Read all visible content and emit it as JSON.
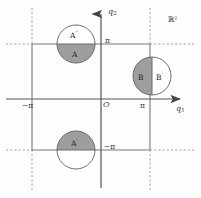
{
  "figure": {
    "name": "torus-fundamental-domain-diagram",
    "plane_label": "ℝ²",
    "origin_label": "O",
    "axes": {
      "x_label": "q",
      "x_sub": "1",
      "y_label": "q",
      "y_sub": "2"
    },
    "ticks": {
      "x_neg_pi": "−π",
      "x_pos_pi": "π",
      "y_pos_pi": "π",
      "y_neg_pi": "−π"
    },
    "regions": [
      {
        "id": "circle-top-left",
        "center_label_upper": "A",
        "upper_prime": "″",
        "center_label_lower": "A",
        "lower_prime": "",
        "split": "horizontal",
        "shaded_half": "lower"
      },
      {
        "id": "circle-right",
        "center_label_left": "B",
        "left_prime": "",
        "center_label_right": "B",
        "right_prime": "′",
        "split": "vertical",
        "shaded_half": "left"
      },
      {
        "id": "circle-bottom",
        "center_label_upper": "A",
        "upper_prime": "′",
        "center_label_lower": "",
        "lower_prime": "",
        "split": "horizontal",
        "shaded_half": "upper"
      }
    ],
    "colors": {
      "shaded_fill": "#9e9e9e",
      "unshaded_fill": "#ffffff",
      "stroke": "#6b6b6b",
      "axis": "#555555",
      "grid_solid": "#777777",
      "grid_dotted": "#9a9a9a",
      "background": "#fdfdfd"
    }
  }
}
